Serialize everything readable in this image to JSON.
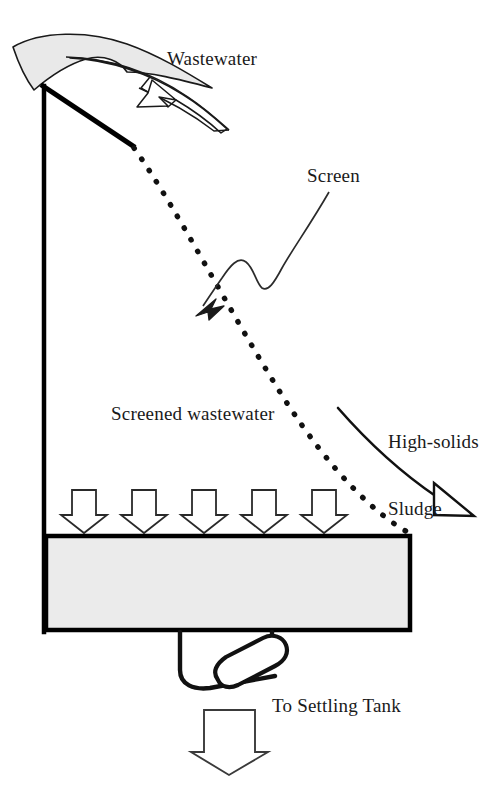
{
  "diagram": {
    "background_color": "#ffffff",
    "line_color": "#000000",
    "fill_color": "#e8e8e8",
    "text_color": "#1a1a1a",
    "labels": {
      "wastewater": "Wastewater",
      "screen": "Screen",
      "high_solids_sludge_line1": "High-solids",
      "high_solids_sludge_line2": "Sludge",
      "screened_wastewater": "Screened wastewater",
      "to_settling_tank": "To Settling Tank"
    },
    "elements": {
      "inflow_wedge": "curved-crescent-inflow-shape",
      "inflow_arrow": "tapered-curved-arrow-wastewater",
      "frame_left_wall": "vertical-structure-wall",
      "frame_top_incline": "inclined-top-beam",
      "screen_curve": "dotted-parabolic-screen",
      "screen_callout": "wavy-leader-arrow",
      "sludge_arrow": "curved-arrow-open-head",
      "percolation_arrows": "five-hollow-down-arrows",
      "collection_tank": "filled-rectangle-tank",
      "outlet_pipe": "u-shaped-outlet-with-valve",
      "discharge_arrow": "hollow-down-arrow"
    },
    "counts": {
      "percolation_arrows": 5
    }
  }
}
